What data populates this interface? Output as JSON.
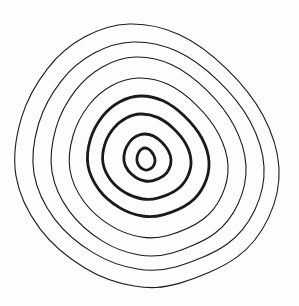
{
  "diagram": {
    "type": "concentric-closed-curves",
    "background": "#fdfdfd",
    "stroke_color": "#1a1a1a",
    "rings": [
      {
        "level": 1,
        "bbox": [
          137,
          148,
          155,
          170
        ],
        "weight": "thick",
        "stroke_width": 2.8
      },
      {
        "level": 2,
        "bbox": [
          124,
          134,
          171,
          181
        ],
        "weight": "thick",
        "stroke_width": 2.8
      },
      {
        "level": 3,
        "bbox": [
          103,
          114,
          191,
          199
        ],
        "weight": "thick",
        "stroke_width": 2.8
      },
      {
        "level": 4,
        "bbox": [
          88,
          96,
          209,
          216
        ],
        "weight": "thick",
        "stroke_width": 2.8
      },
      {
        "level": 5,
        "bbox": [
          70,
          78,
          228,
          237
        ],
        "weight": "thin",
        "stroke_width": 1.1
      },
      {
        "level": 6,
        "bbox": [
          52,
          57,
          246,
          255
        ],
        "weight": "thin",
        "stroke_width": 1.1
      },
      {
        "level": 7,
        "bbox": [
          34,
          42,
          264,
          269
        ],
        "weight": "thin",
        "stroke_width": 1.1
      },
      {
        "level": 8,
        "bbox": [
          16,
          24,
          279,
          286
        ],
        "weight": "thin",
        "stroke_width": 1.1
      }
    ]
  }
}
